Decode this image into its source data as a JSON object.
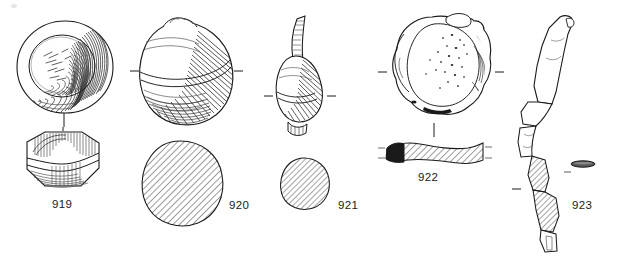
{
  "plate": {
    "type": "archaeological-artifact-illustration-plate",
    "background_color": "#ffffff",
    "ink_color": "#1a1a1a",
    "width": 618,
    "height": 260,
    "description": "Line drawing plate of five artefacts with plan views, profiles and hatched sections"
  },
  "figures": [
    {
      "id": "919",
      "label": "919",
      "label_x": 66,
      "label_y": 203,
      "views": [
        "plan-view-circular-hatched",
        "profile-view-faceted"
      ],
      "section_hatched": false,
      "notes": "Circular disc with inner concentric ring and dense shading on right; faceted hexagonal side profile below"
    },
    {
      "id": "920",
      "label": "920",
      "label_x": 236,
      "label_y": 205,
      "views": [
        "plan-view-bulbous",
        "section-ellipse-hatched"
      ],
      "section_hatched": true,
      "notes": "Rounded bulbous object with shading hatch right side; large hatched oval section below"
    },
    {
      "id": "921",
      "label": "921",
      "label_x": 341,
      "label_y": 205,
      "views": [
        "profile-view-pear-with-stem",
        "section-ellipse-hatched"
      ],
      "section_hatched": true,
      "notes": "Pear-shaped body with curved stem/neck; small hatched oval section below"
    },
    {
      "id": "922",
      "label": "922",
      "label_x": 420,
      "label_y": 177,
      "views": [
        "plan-view-lumpy-stippled",
        "section-elongated-hatched-with-solid-end"
      ],
      "section_hatched": true,
      "notes": "Irregular lumpy rounded mass with stippled surface; thin elongated hatched section with solid black left terminal"
    },
    {
      "id": "923",
      "label": "923",
      "label_x": 577,
      "label_y": 205,
      "views": [
        "profile-view-long-bent-shaft",
        "section-small-dark-ellipse"
      ],
      "section_hatched": false,
      "notes": "Long bent shaft shown vertically, upper part outlined, lower part hatched; small dark flattened ellipse section to the right"
    }
  ],
  "tick_marks": {
    "description": "Short alignment tick marks flanking plan views and vertical connector strokes linking plan to profile",
    "count": 12
  }
}
